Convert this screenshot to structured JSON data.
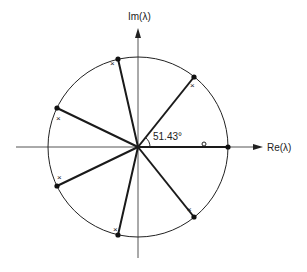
{
  "diagram": {
    "type": "complex-plane root diagram",
    "axes": {
      "imag_label": "Im(λ)",
      "real_label": "Re(λ)"
    },
    "unit_circle": {
      "center": [
        138,
        147
      ],
      "radius": 90
    },
    "angle_label": "51.43°",
    "spokes_deg": [
      0,
      51.43,
      102.86,
      154.29,
      205.71,
      257.14,
      308.57
    ],
    "root_markers": {
      "dot_symbol": "●",
      "cross_symbol": "×",
      "circle_symbol": "o"
    },
    "colors": {
      "stroke": "#1a1a1a",
      "background": "#ffffff"
    }
  }
}
